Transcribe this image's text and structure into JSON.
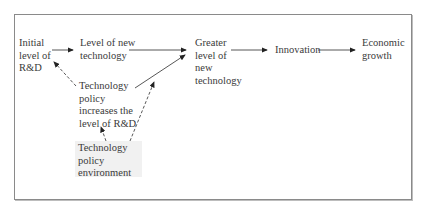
{
  "diagram": {
    "nodes": [
      {
        "id": "initial-rd",
        "label": "Initial\nlevel of\nR&D"
      },
      {
        "id": "new-tech",
        "label": "Level of new\ntechnology"
      },
      {
        "id": "greater-tech",
        "label": "Greater\nlevel of\nnew\ntechnology"
      },
      {
        "id": "innovation",
        "label": "Innovation"
      },
      {
        "id": "growth",
        "label": "Economic\ngrowth"
      },
      {
        "id": "policy-rd",
        "label": "Technology\npolicy\nincreases the\nlevel of R&D"
      },
      {
        "id": "policy-env",
        "label": "Technology\npolicy\nenvironment"
      }
    ],
    "edges": [
      {
        "from": "initial-rd",
        "to": "new-tech",
        "style": "solid"
      },
      {
        "from": "new-tech",
        "to": "greater-tech",
        "style": "solid"
      },
      {
        "from": "greater-tech",
        "to": "innovation",
        "style": "solid"
      },
      {
        "from": "innovation",
        "to": "growth",
        "style": "solid"
      },
      {
        "from": "policy-rd",
        "to": "initial-rd",
        "style": "dashed"
      },
      {
        "from": "policy-rd",
        "to": "greater-tech",
        "style": "solid"
      },
      {
        "from": "policy-env",
        "to": "policy-rd",
        "style": "dashed"
      },
      {
        "from": "policy-env",
        "to": "greater-tech",
        "style": "dashed"
      }
    ],
    "colors": {
      "line": "#333333",
      "frame": "#8a8a8a",
      "shade": "#f1f1f1"
    }
  }
}
